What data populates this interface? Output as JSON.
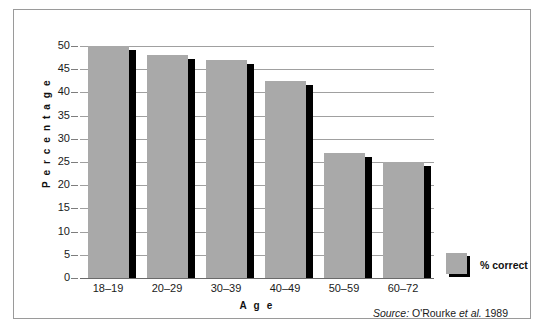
{
  "chart_data": {
    "type": "bar",
    "title": "",
    "xlabel": "A g e",
    "ylabel": "P e r c e n t a g e",
    "categories": [
      "18–19",
      "20–29",
      "30–39",
      "40–49",
      "50–59",
      "60–72"
    ],
    "series": [
      {
        "name": "% correct",
        "values": [
          50,
          48,
          47,
          42.5,
          27,
          25
        ]
      }
    ],
    "ylim": [
      0,
      50
    ],
    "yticks": [
      0,
      5,
      10,
      15,
      20,
      25,
      30,
      35,
      40,
      45,
      50
    ],
    "ytick_labels": [
      "0",
      "5",
      "10",
      "15",
      "20",
      "25",
      "30",
      "35",
      "40",
      "45",
      "50"
    ],
    "grid": true,
    "legend_position": "right",
    "bar_color": "#a9a9a9",
    "shadow_color": "#000000",
    "gridline_color": "#a0a0a0"
  },
  "legend": {
    "entries": [
      {
        "label": "% correct",
        "color": "#a9a9a9"
      }
    ]
  },
  "axes": {
    "y_title": "P e r c e n t a g e",
    "x_title": "A g e"
  },
  "source": {
    "prefix": "Source:",
    "author": "O'Rourke ",
    "etal": "et al.",
    "year": " 1989",
    "full": "Source: O'Rourke et al. 1989"
  }
}
